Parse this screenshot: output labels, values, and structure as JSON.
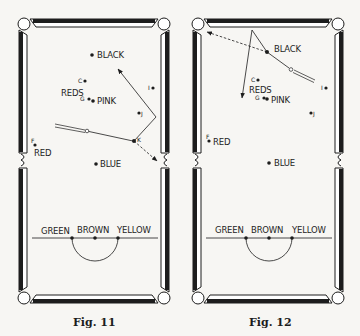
{
  "figures": [
    {
      "caption": "Fig. 11",
      "labels": {
        "black": "BLACK",
        "reds": "REDS",
        "pink": "PINK",
        "red": "RED",
        "blue": "BLUE",
        "green": "GREEN",
        "brown": "BROWN",
        "yellow": "YELLOW",
        "c": "C",
        "g": "G",
        "i": "I",
        "j": "J",
        "k": "K",
        "f": "F"
      }
    },
    {
      "caption": "Fig. 12",
      "labels": {
        "black": "BLACK",
        "reds": "REDS",
        "pink": "PINK",
        "red": "RED",
        "blue": "BLUE",
        "green": "GREEN",
        "brown": "BROWN",
        "yellow": "YELLOW",
        "c": "C",
        "g": "G",
        "i": "I",
        "j": "J",
        "f": "F"
      }
    }
  ],
  "colors": {
    "ink": "#1d1d1d",
    "paper": "#f7f6f3"
  }
}
